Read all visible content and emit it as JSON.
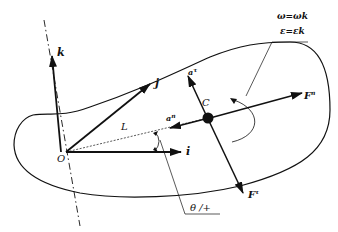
{
  "diagram": {
    "labels": {
      "k": "k",
      "j": "j",
      "i": "i",
      "origin": "O",
      "center": "C",
      "length": "L",
      "a_n": "a",
      "a_n_sup": "n",
      "a_t": "a",
      "a_t_sup": "τ",
      "F_n": "F",
      "F_n_sup": "n",
      "F_t": "F",
      "F_t_sup": "τ",
      "omega_eq": "ω=ωk",
      "epsilon_eq": "ε=εk",
      "theta": "θ /+"
    },
    "colors": {
      "stroke": "#111111",
      "background": "#ffffff"
    }
  }
}
